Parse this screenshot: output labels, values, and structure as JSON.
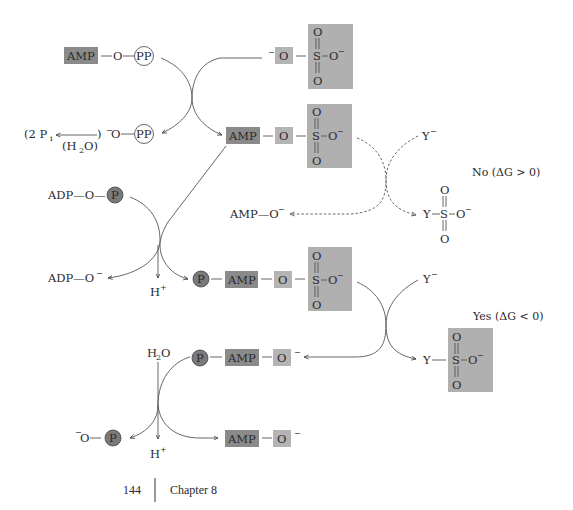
{
  "colors": {
    "amp_box": "#8a8a8a",
    "o_box": "#b4b4b4",
    "sulfate_box": "#b0b0b0",
    "phosphate_circle": "#7a7a7a",
    "line": "#555555"
  },
  "step1": {
    "reactant_atp": {
      "amp": "AMP",
      "o": "O",
      "pp": "PP"
    },
    "reactant_sulfate": {
      "o_minus": "O",
      "s": "S",
      "o_top": "O",
      "o_bottom": "O",
      "o_right": "O",
      "charge": "−"
    },
    "product_pp": {
      "o": "O",
      "pp": "PP",
      "charge": "−"
    },
    "hydrolysis": {
      "label": "(2  P",
      "sub": "i",
      "water": "(H",
      "water_sub": "2",
      "water_end": "O)",
      "close": ")"
    },
    "product_aps": {
      "amp": "AMP",
      "o": "O",
      "s": "S",
      "o_top": "O",
      "o_bottom": "O",
      "o_right": "O"
    }
  },
  "direct_transfer": {
    "nucleophile": "Y",
    "charge": "−",
    "product_amp": "AMP—O",
    "product_ys": {
      "y": "Y",
      "s": "S",
      "o_top": "O",
      "o_bottom": "O",
      "o_right": "O"
    },
    "verdict": "No  (ΔG > 0)"
  },
  "step2": {
    "reactant_atp": {
      "adp": "ADP—O—",
      "p": "P"
    },
    "product_adp": "ADP—O",
    "proton": "H",
    "proton_charge": "+",
    "product_paps": {
      "p": "P",
      "amp": "AMP",
      "o": "O",
      "s": "S",
      "o_top": "O",
      "o_bottom": "O",
      "o_right": "O"
    }
  },
  "step3": {
    "nucleophile": "Y",
    "verdict": "Yes  (ΔG < 0)",
    "product_pap": {
      "p": "P",
      "amp": "AMP",
      "o": "O"
    },
    "product_ys": {
      "y": "Y",
      "s": "S",
      "o_top": "O",
      "o_bottom": "O",
      "o_right": "O"
    }
  },
  "step4": {
    "water": "H",
    "water_sub": "2",
    "water_end": "O",
    "phosphate": {
      "o": "O",
      "p": "P"
    },
    "proton": "H",
    "product_amp": {
      "amp": "AMP",
      "o": "O"
    }
  },
  "footer": {
    "page_number": "144",
    "chapter": "Chapter 8"
  }
}
